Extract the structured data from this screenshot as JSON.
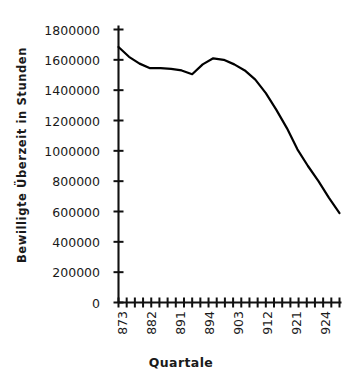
{
  "chart_data": {
    "type": "line",
    "title": "",
    "xlabel": "Quartale",
    "ylabel": "Bewilligte Überzeit in Stunden",
    "ylim": [
      0,
      1800000
    ],
    "ytick_labels": [
      "1800000",
      "1600000",
      "1400000",
      "1200000",
      "1000000",
      "800000",
      "600000",
      "400000",
      "200000",
      "0"
    ],
    "ytick_values": [
      1800000,
      1600000,
      1400000,
      1200000,
      1000000,
      800000,
      600000,
      400000,
      200000,
      0
    ],
    "xtick_labels": [
      "873",
      "882",
      "891",
      "894",
      "903",
      "912",
      "921",
      "924"
    ],
    "x_tick_count": 28,
    "grid": false,
    "legend": "none",
    "line_color": "#000000",
    "line_width": 2.2,
    "series": [
      {
        "name": "Bewilligte Überzeit",
        "x": [
          "873",
          "874",
          "881",
          "882",
          "883",
          "884",
          "891",
          "892",
          "893",
          "894",
          "901",
          "902",
          "903",
          "904",
          "911",
          "912",
          "913",
          "914",
          "921",
          "922",
          "923",
          "924"
        ],
        "values": [
          1685000,
          1620000,
          1575000,
          1545000,
          1545000,
          1540000,
          1530000,
          1505000,
          1570000,
          1610000,
          1600000,
          1570000,
          1530000,
          1470000,
          1380000,
          1270000,
          1150000,
          1010000,
          900000,
          800000,
          690000,
          590000
        ]
      }
    ]
  }
}
